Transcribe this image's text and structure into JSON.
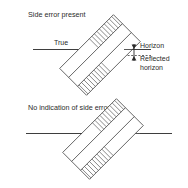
{
  "figure": {
    "title_top": "Side error present",
    "title_bottom": "No indication of side error",
    "labels": {
      "true": "True",
      "horizon": "Horizon",
      "reflected_line1": "Reflected",
      "reflected_line2": "horizon"
    },
    "colors": {
      "background": "#ffffff",
      "line": "#3a3a3a",
      "text": "#2b2b2b",
      "hatch": "#525252"
    },
    "icons": {
      "arrow_up": "arrow-up-icon",
      "arrow_down": "arrow-down-icon"
    }
  }
}
